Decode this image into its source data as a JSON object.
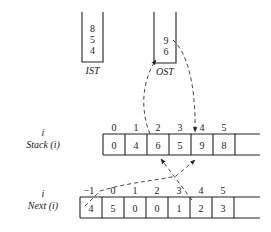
{
  "ist": {
    "label": "IST",
    "values": [
      "8",
      "5",
      "4"
    ]
  },
  "ost": {
    "label": "OST",
    "values": [
      "9",
      "6"
    ]
  },
  "stack": {
    "label_top": "i",
    "label": "Stack (i)",
    "indices": [
      "0",
      "1",
      "2",
      "3",
      "4",
      "5"
    ],
    "values": [
      "0",
      "4",
      "6",
      "5",
      "9",
      "8"
    ]
  },
  "next": {
    "label_top": "i",
    "label": "Next (i)",
    "indices": [
      "−1",
      "0",
      "1",
      "2",
      "3",
      "4",
      "5"
    ],
    "values": [
      "4",
      "5",
      "0",
      "0",
      "1",
      "2",
      "3"
    ]
  }
}
